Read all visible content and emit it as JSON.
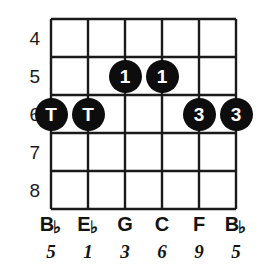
{
  "diagram": {
    "type": "guitar-fretboard-chord-diagram",
    "title": "",
    "strings_count": 6,
    "frets_shown": 5,
    "fret_numbers": [
      "4",
      "5",
      "6",
      "7",
      "8"
    ],
    "string_names": [
      {
        "letter": "B",
        "accidental": "♭"
      },
      {
        "letter": "E",
        "accidental": "♭"
      },
      {
        "letter": "G",
        "accidental": ""
      },
      {
        "letter": "C",
        "accidental": ""
      },
      {
        "letter": "F",
        "accidental": ""
      },
      {
        "letter": "B",
        "accidental": "♭"
      }
    ],
    "intervals": [
      "5",
      "1",
      "3",
      "6",
      "9",
      "5"
    ],
    "markers": [
      {
        "label": "T",
        "string": 1,
        "fret": "6"
      },
      {
        "label": "T",
        "string": 2,
        "fret": "6"
      },
      {
        "label": "1",
        "string": 3,
        "fret": "5"
      },
      {
        "label": "1",
        "string": 4,
        "fret": "5"
      },
      {
        "label": "3",
        "string": 5,
        "fret": "6"
      },
      {
        "label": "3",
        "string": 6,
        "fret": "6"
      }
    ],
    "colors": {
      "marker_fill": "#0d0d0d",
      "marker_text": "#ffffff",
      "grid_line": "#1a1a1a",
      "background": "#ffffff",
      "label_text": "#141414"
    }
  }
}
